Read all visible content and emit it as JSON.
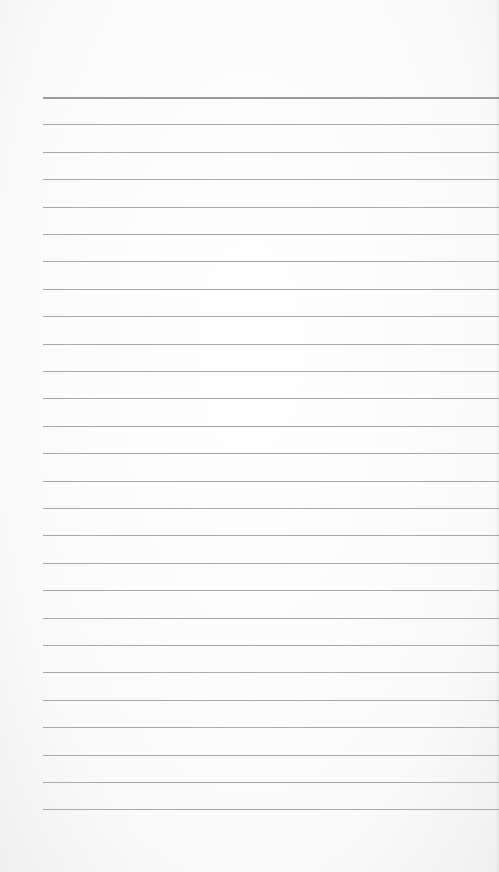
{
  "page": {
    "type": "lined-paper",
    "line_count": 27,
    "first_line_y": 97,
    "line_spacing": 27.4,
    "line_left": 43,
    "line_color": "#a9a9a9",
    "background": "#fbfbfb"
  }
}
